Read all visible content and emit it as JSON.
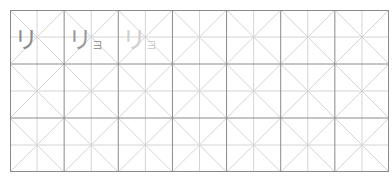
{
  "worksheet": {
    "columns": 7,
    "rows": 3,
    "cell_size": 54,
    "colors": {
      "border": "#8a8a8a",
      "guide": "#d4d4d4"
    },
    "practice_cells": [
      {
        "main": "リ",
        "small": "",
        "color": "#8c8c8c"
      },
      {
        "main": "リ",
        "small": "ョ",
        "color": "#9a9a9a"
      },
      {
        "main": "リ",
        "small": "ョ",
        "color": "#cfcfcf"
      }
    ]
  }
}
